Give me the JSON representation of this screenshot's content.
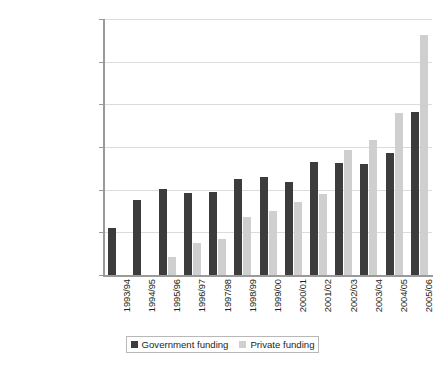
{
  "chart_data": {
    "type": "bar",
    "title": "",
    "subtitle": "",
    "xlabel": "",
    "ylabel": "",
    "ylim": [
      0,
      60000000000
    ],
    "ytick_step": 10000000000,
    "grid": true,
    "legend_position": "bottom",
    "categories": [
      "1993/94",
      "1994/95",
      "1995/96",
      "1996/97",
      "1997/98",
      "1998/99",
      "1999/00",
      "2000/01",
      "2001/02",
      "2002/03",
      "2003/04",
      "2004/05",
      "2005/06"
    ],
    "ytick_labels": [
      "0",
      "10,000,000,000",
      "20,000,000,000",
      "30,000,000,000",
      "40,000,000,000",
      "50,000,000,000",
      "60,000,000,000"
    ],
    "ytick_values": [
      0,
      10000000000,
      20000000000,
      30000000000,
      40000000000,
      50000000000,
      60000000000
    ],
    "series": [
      {
        "name": "Government funding",
        "color": "#3d3c3c",
        "values": [
          11000000000,
          17600000000,
          20200000000,
          19300000000,
          19500000000,
          22400000000,
          22900000000,
          21900000000,
          26500000000,
          26200000000,
          26000000000,
          28600000000,
          38200000000
        ]
      },
      {
        "name": "Private funding",
        "color": "#cfcfcf",
        "values": [
          0,
          0,
          4300000000,
          7400000000,
          8400000000,
          13700000000,
          14900000000,
          17000000000,
          19000000000,
          29200000000,
          31600000000,
          38000000000,
          56200000000
        ]
      }
    ]
  },
  "legend": {
    "items": [
      {
        "label": "Government funding",
        "color": "#3d3c3c"
      },
      {
        "label": "Private funding",
        "color": "#cfcfcf"
      }
    ]
  }
}
